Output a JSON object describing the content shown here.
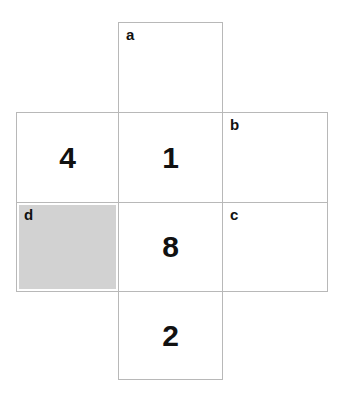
{
  "figure": {
    "kind": "cube-net",
    "background_color": "#ffffff",
    "border_color": "#b8b8b8",
    "text_color": "#111111",
    "shaded_color": "#d2d2d2"
  },
  "cells": {
    "a": {
      "label": "a",
      "value": ""
    },
    "left": {
      "label": "",
      "value": "4"
    },
    "middle_upper": {
      "label": "",
      "value": "1"
    },
    "b": {
      "label": "b",
      "value": ""
    },
    "d": {
      "label": "d",
      "value": ""
    },
    "middle_lower": {
      "label": "",
      "value": "8"
    },
    "c": {
      "label": "c",
      "value": ""
    },
    "bottom": {
      "label": "",
      "value": "2"
    }
  }
}
